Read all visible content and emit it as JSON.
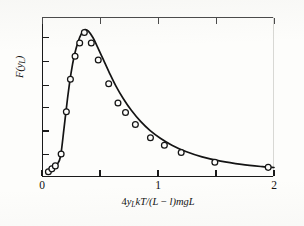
{
  "figure": {
    "background_color": "#fdfdfb",
    "ink_color": "#141414"
  },
  "axes": {
    "xlabel_parts": {
      "lead": "4",
      "var_y": "y",
      "var_y_sub": "L",
      "mid": "kT/(L",
      "minus": " − ",
      "ell": "l",
      "tail": ")mgL"
    },
    "ylabel_parts": {
      "fn": "F(y",
      "sub": "L",
      "close": ")"
    },
    "xtick_labels": [
      "0",
      "1",
      "2"
    ]
  },
  "chart_data": {
    "type": "scatter",
    "title": "",
    "subtitle": "",
    "xlabel": "4y_L kT/(L − l)mgL",
    "ylabel": "F(y_L)",
    "xlim": [
      0,
      2
    ],
    "ylim": [
      0,
      1.08
    ],
    "grid": false,
    "legend": null,
    "legend_position": "none",
    "x_ticks": [
      0,
      0.5,
      1,
      1.5,
      2
    ],
    "x_tick_labels": [
      "0",
      "",
      "1",
      "",
      "2"
    ],
    "y_ticks": [
      0.15,
      0.31,
      0.47,
      0.62,
      0.78,
      0.94
    ],
    "y_tick_labels": [
      "",
      "",
      "",
      "",
      "",
      ""
    ],
    "marker_style": "open-circle",
    "series": [
      {
        "name": "measured points",
        "type": "scatter",
        "x": [
          0.055,
          0.085,
          0.115,
          0.165,
          0.21,
          0.245,
          0.285,
          0.325,
          0.365,
          0.425,
          0.485,
          0.575,
          0.655,
          0.72,
          0.805,
          0.935,
          1.055,
          1.2,
          1.49,
          1.95
        ],
        "y": [
          0.035,
          0.055,
          0.075,
          0.155,
          0.44,
          0.66,
          0.815,
          0.905,
          0.975,
          0.905,
          0.79,
          0.63,
          0.5,
          0.435,
          0.355,
          0.265,
          0.215,
          0.165,
          0.1,
          0.065
        ]
      },
      {
        "name": "fitted curve",
        "type": "line",
        "x": [
          0.04,
          0.09,
          0.13,
          0.16,
          0.19,
          0.22,
          0.25,
          0.28,
          0.31,
          0.34,
          0.37,
          0.4,
          0.44,
          0.48,
          0.53,
          0.58,
          0.64,
          0.7,
          0.77,
          0.85,
          0.93,
          1.02,
          1.12,
          1.24,
          1.38,
          1.54,
          1.72,
          1.9,
          2.0
        ],
        "y": [
          0.03,
          0.055,
          0.085,
          0.14,
          0.33,
          0.53,
          0.7,
          0.825,
          0.91,
          0.968,
          0.995,
          0.985,
          0.94,
          0.875,
          0.79,
          0.705,
          0.61,
          0.53,
          0.45,
          0.375,
          0.315,
          0.262,
          0.215,
          0.172,
          0.136,
          0.107,
          0.085,
          0.07,
          0.064
        ]
      }
    ]
  }
}
